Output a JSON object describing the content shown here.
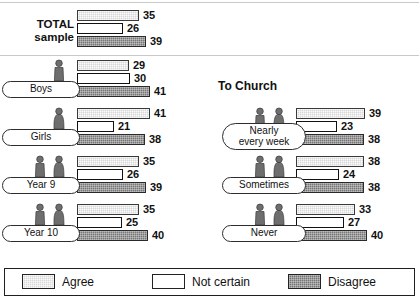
{
  "legend": {
    "items": [
      {
        "key": "agree",
        "label": "Agree",
        "color": "#d8d8d8"
      },
      {
        "key": "notcertain",
        "label": "Not certain",
        "color": "#ffffff"
      },
      {
        "key": "disagree",
        "label": "Disagree",
        "color": "#767676"
      }
    ]
  },
  "left_panel": {
    "total_label_line1": "TOTAL",
    "total_label_line2": "sample"
  },
  "right_panel": {
    "heading": "To Church"
  },
  "chart_data": {
    "type": "bar",
    "title": "",
    "subtitle": "",
    "xlabel": "",
    "ylabel": "",
    "orientation": "horizontal",
    "grid": false,
    "legend_position": "bottom",
    "xlim": [
      0,
      45
    ],
    "value_unit": "%",
    "series": [
      {
        "name": "Agree",
        "key": "agree"
      },
      {
        "name": "Not certain",
        "key": "notcertain"
      },
      {
        "name": "Disagree",
        "key": "disagree"
      }
    ],
    "panels": [
      {
        "name": "left",
        "heading": "",
        "groups": [
          {
            "id": "total",
            "label": "TOTAL sample",
            "icons": 0,
            "values": {
              "agree": 35,
              "notcertain": 26,
              "disagree": 39
            }
          },
          {
            "id": "boys",
            "label": "Boys",
            "icons": 1,
            "icon_types": [
              "boy"
            ],
            "values": {
              "agree": 29,
              "notcertain": 30,
              "disagree": 41
            }
          },
          {
            "id": "girls",
            "label": "Girls",
            "icons": 1,
            "icon_types": [
              "girl"
            ],
            "values": {
              "agree": 41,
              "notcertain": 21,
              "disagree": 38
            }
          },
          {
            "id": "year9",
            "label": "Year 9",
            "icons": 2,
            "icon_types": [
              "boy",
              "girl"
            ],
            "values": {
              "agree": 35,
              "notcertain": 26,
              "disagree": 39
            }
          },
          {
            "id": "year10",
            "label": "Year 10",
            "icons": 2,
            "icon_types": [
              "boy",
              "girl"
            ],
            "values": {
              "agree": 35,
              "notcertain": 25,
              "disagree": 40
            }
          }
        ]
      },
      {
        "name": "right",
        "heading": "To Church",
        "groups": [
          {
            "id": "nearly",
            "label": "Nearly\never​y week",
            "label_line1": "Nearly",
            "label_line2": "every week",
            "icons": 2,
            "icon_types": [
              "boy",
              "girl"
            ],
            "values": {
              "agree": 39,
              "notcertain": 23,
              "disagree": 38
            }
          },
          {
            "id": "sometimes",
            "label": "Sometimes",
            "icons": 2,
            "icon_types": [
              "boy",
              "girl"
            ],
            "values": {
              "agree": 38,
              "notcertain": 24,
              "disagree": 38
            }
          },
          {
            "id": "never",
            "label": "Never",
            "icons": 2,
            "icon_types": [
              "boy",
              "girl"
            ],
            "values": {
              "agree": 33,
              "notcertain": 27,
              "disagree": 40
            }
          }
        ]
      }
    ]
  }
}
